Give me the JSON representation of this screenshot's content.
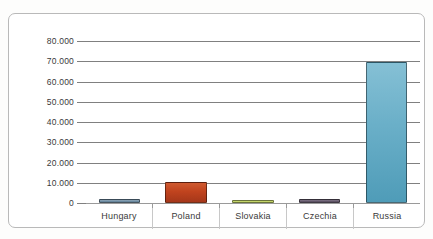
{
  "chart_data": {
    "type": "bar",
    "title": "",
    "subtitle": "",
    "xlabel": "",
    "ylabel": "",
    "categories": [
      "Hungary",
      "Poland",
      "Slovakia",
      "Czechia",
      "Russia"
    ],
    "values": [
      1000,
      9500,
      500,
      1000,
      68500
    ],
    "series": [
      {
        "name": "",
        "values": [
          1000,
          9500,
          500,
          1000,
          68500
        ]
      }
    ],
    "ylim": [
      0,
      80000
    ],
    "ytick_values": [
      80000,
      70000,
      60000,
      50000,
      40000,
      30000,
      20000,
      10000,
      0
    ],
    "ytick_labels": [
      "80.000",
      "70.000",
      "60.000",
      "50.000",
      "40.000",
      "30.000",
      "20.000",
      "10.000",
      "0"
    ],
    "thousands_separator": ".",
    "grid": true,
    "grid_axis": "y",
    "legend": false,
    "legend_position": "none",
    "bar_colors": [
      "#7693a8",
      "#c0431e",
      "#c5d66c",
      "#6b5f72",
      "#6aafc8"
    ],
    "bar_colors_top": [
      "#93a9ba",
      "#cf5a30",
      "#d3e08a",
      "#837889",
      "#85c0d5"
    ],
    "bar_colors_bottom": [
      "#5f7f96",
      "#a5371a",
      "#b0c452",
      "#564b5d",
      "#4f9cb8"
    ],
    "gridline_color": "#808080",
    "axis_label_color": "#3a3a3a",
    "plot_background": "#ffffff",
    "frame_border_color": "#b9b9b9"
  }
}
